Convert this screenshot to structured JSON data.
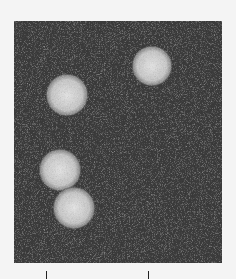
{
  "image": {
    "subject": "electron micrograph of spherical virus particles",
    "particle_count": 4,
    "background_tone": "#3a3a3a",
    "particle_tone": "#cfcfcf"
  },
  "scale_bar": {
    "label": ""
  }
}
